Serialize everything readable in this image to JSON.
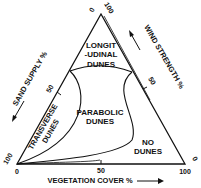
{
  "diagram": {
    "type": "ternary",
    "axes": {
      "left": {
        "label": "SAND SUPPLY %",
        "tick_mid": "50",
        "tick_min": "0",
        "tick_max": "100"
      },
      "right": {
        "label": "WIND STRENGTH %",
        "tick_mid": "50",
        "tick_min": "0",
        "tick_max": "100"
      },
      "bottom": {
        "label": "VEGETATION COVER %",
        "tick_min": "0",
        "tick_mid": "50",
        "tick_max": "100"
      }
    },
    "regions": {
      "longitudinal_line1": "LONGIT",
      "longitudinal_line2": "-UDINAL",
      "longitudinal_line3": "DUNES",
      "transverse_line1": "TRANSVERSE",
      "transverse_line2": "DUNES",
      "parabolic_line1": "PARABOLIC",
      "parabolic_line2": "DUNES",
      "none_line1": "NO",
      "none_line2": "DUNES"
    }
  }
}
